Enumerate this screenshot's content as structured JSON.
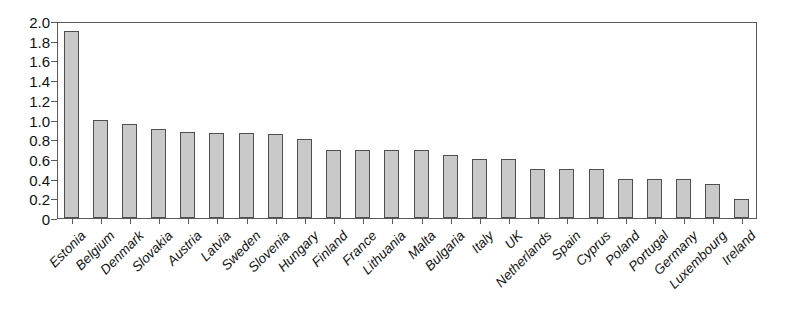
{
  "chart_data": {
    "type": "bar",
    "title": "",
    "subtitle": "",
    "xlabel": "",
    "ylabel": "",
    "ylim": [
      0,
      2.0
    ],
    "ytick_labels": [
      "2.0",
      "1.8",
      "1.6",
      "1.4",
      "1.2",
      "1.0",
      "0.8",
      "0.6",
      "0.4",
      "0.2",
      "0"
    ],
    "ytick_values": [
      2.0,
      1.8,
      1.6,
      1.4,
      1.2,
      1.0,
      0.8,
      0.6,
      0.4,
      0.2,
      0
    ],
    "grid": false,
    "legend": null,
    "bar_fill_color": "#c9c9c9",
    "bar_edge_color": "#4f4f4f",
    "categories": [
      "Estonia",
      "Belgium",
      "Denmark",
      "Slovakia",
      "Austria",
      "Latvia",
      "Sweden",
      "Slovenia",
      "Hungary",
      "Finland",
      "France",
      "Lithuania",
      "Malta",
      "Bulgaria",
      "Italy",
      "UK",
      "Netherlands",
      "Spain",
      "Cyprus",
      "Poland",
      "Portugal",
      "Germany",
      "Luxembourg",
      "Ireland"
    ],
    "values": [
      1.9,
      1.0,
      0.95,
      0.9,
      0.87,
      0.86,
      0.86,
      0.85,
      0.8,
      0.69,
      0.69,
      0.69,
      0.69,
      0.64,
      0.6,
      0.6,
      0.5,
      0.5,
      0.5,
      0.4,
      0.4,
      0.4,
      0.35,
      0.19
    ]
  }
}
